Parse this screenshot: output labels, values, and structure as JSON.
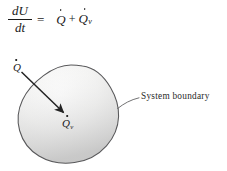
{
  "figure": {
    "caption_none": "",
    "equation": {
      "numerator": "dU",
      "denominator": "dt",
      "equals": "=",
      "term_1_base": "Q",
      "term_1_subscript": "",
      "operator": "+",
      "term_2_base": "Q",
      "term_2_subscript": "v"
    },
    "labels": {
      "heat_in_base": "Q",
      "heat_in_subscript": "",
      "volumetric_base": "Q",
      "volumetric_subscript": "v",
      "system_boundary": "System boundary"
    },
    "icons": {
      "arrow": "arrow-icon",
      "leader_line": "leader-line-icon",
      "blob": "system-blob-icon"
    },
    "colors": {
      "background": "#ffffff",
      "ink": "#1a1a1a",
      "outline": "#4a4a4a",
      "blob_fill_light": "#f7f7f6",
      "blob_fill_shade": "#dedede",
      "arrow": "#232323"
    }
  }
}
